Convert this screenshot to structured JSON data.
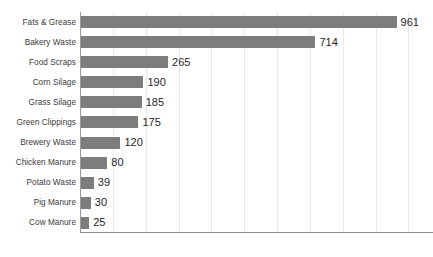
{
  "chart_data": {
    "type": "bar",
    "orientation": "horizontal",
    "title": "",
    "subtitle": "",
    "xlabel": "",
    "ylabel": "",
    "categories": [
      "Fats & Grease",
      "Bakery Waste",
      "Food Scraps",
      "Corn Silage",
      "Grass Silage",
      "Green Clippings",
      "Brewery Waste",
      "Chicken Manure",
      "Potato Waste",
      "Pig Manure",
      "Cow Manure"
    ],
    "values": [
      961,
      714,
      265,
      190,
      185,
      175,
      120,
      80,
      39,
      30,
      25
    ],
    "value_labels": [
      "961",
      "714",
      "265",
      "190",
      "185",
      "175",
      "120",
      "80",
      "39",
      "30",
      "25"
    ],
    "xlim": [
      0,
      1075
    ],
    "gridline_values": [
      100,
      200,
      300,
      400,
      500,
      600,
      700,
      800,
      900,
      1000
    ],
    "grid": true,
    "legend": "none",
    "tick_labels_x": [],
    "bar_color": "#7d7d7d",
    "gridline_color": "#e7e7e7",
    "axis_color": "#8c8c8c",
    "label_color": "#3a3a3a",
    "value_label_color": "#252525",
    "background_color": "#ffffff"
  }
}
